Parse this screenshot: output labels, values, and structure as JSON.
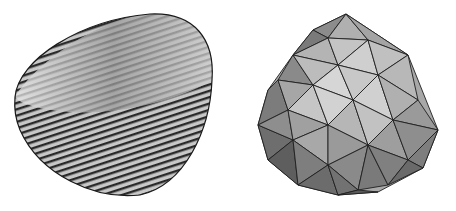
{
  "figures": [
    {
      "name": "striped-bowl-surface",
      "description": "3D bowl-shaped surface rendered with dense stripe texture"
    },
    {
      "name": "faceted-polyhedral-mesh",
      "description": "3D triangulated mesh approximation of the same surface, flat-shaded gray facets"
    }
  ],
  "colors": {
    "background": "#ffffff",
    "stroke": "#1a1a1a",
    "light": "#d8d8d8",
    "mid": "#a0a0a0",
    "dark": "#606060"
  }
}
